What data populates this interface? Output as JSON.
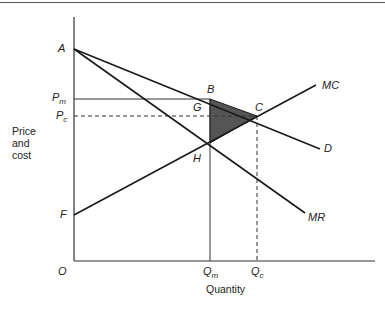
{
  "diagram": {
    "type": "economics-deadweight-loss",
    "axes": {
      "y_label_lines": [
        "Price",
        "and",
        "cost"
      ],
      "x_label": "Quantity",
      "origin_label": "O"
    },
    "points": {
      "A": "A",
      "B": "B",
      "C": "C",
      "G": "G",
      "H": "H",
      "F": "F"
    },
    "curves": {
      "mc": "MC",
      "demand": "D",
      "mr": "MR"
    },
    "price_labels": {
      "pm_main": "P",
      "pm_sub": "m",
      "pc_main": "P",
      "pc_sub": "c"
    },
    "quantity_labels": {
      "qm_main": "Q",
      "qm_sub": "m",
      "qc_main": "Q",
      "qc_sub": "c"
    },
    "shaded_region": "triangle BCH",
    "colors": {
      "line": "#1a1a1a",
      "shade": "#555555"
    }
  }
}
